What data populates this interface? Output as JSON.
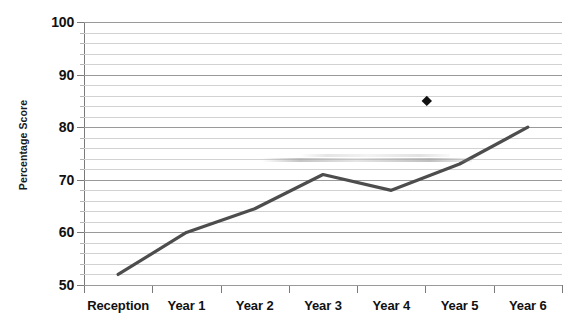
{
  "chart_data": {
    "type": "line",
    "title": "",
    "xlabel": "",
    "ylabel": "Percentage Score",
    "categories": [
      "Reception",
      "Year 1",
      "Year 2",
      "Year 3",
      "Year 4",
      "Year 5",
      "Year 6"
    ],
    "series": [
      {
        "name": "Percentage Score",
        "values": [
          52,
          60,
          64.5,
          71,
          68,
          73,
          80
        ],
        "color": "#4d4d4d",
        "marker": "none"
      }
    ],
    "point_markers": [
      {
        "name": "diamond-marker",
        "category": "Year 4",
        "x": 4.52,
        "value": 85,
        "shape": "diamond",
        "color": "#111111"
      }
    ],
    "ylim": [
      50,
      100
    ],
    "y_major_ticks": [
      50,
      60,
      70,
      80,
      90,
      100
    ],
    "y_minor_step": 2,
    "y_tick_labels": [
      "100",
      "90",
      "80",
      "70",
      "60",
      "50"
    ],
    "grid": true,
    "grid_major_color": "#9a9a9a",
    "grid_minor_color": "#d2d2d2",
    "axis_color": "#7a7a7a",
    "legend": "none",
    "background": "#ffffff"
  }
}
